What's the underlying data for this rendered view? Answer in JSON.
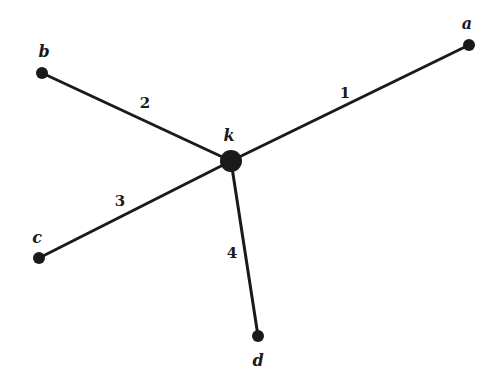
{
  "diagram": {
    "type": "star-graph",
    "colors": {
      "background": "#ffffff",
      "ink": "#1a1a1a"
    },
    "center": {
      "id": "k",
      "label": "k",
      "x": 231,
      "y": 161,
      "r": 11,
      "label_x": 229,
      "label_y": 141
    },
    "nodes": [
      {
        "id": "a",
        "label": "a",
        "x": 469,
        "y": 45,
        "r": 6,
        "label_x": 467,
        "label_y": 29
      },
      {
        "id": "b",
        "label": "b",
        "x": 42,
        "y": 73,
        "r": 6,
        "label_x": 44,
        "label_y": 57
      },
      {
        "id": "c",
        "label": "c",
        "x": 39,
        "y": 258,
        "r": 6,
        "label_x": 37,
        "label_y": 243
      },
      {
        "id": "d",
        "label": "d",
        "x": 258,
        "y": 336,
        "r": 6,
        "label_x": 258,
        "label_y": 366
      }
    ],
    "edges": [
      {
        "id": "1",
        "label": "1",
        "from": "k",
        "to": "a",
        "label_x": 345,
        "label_y": 98
      },
      {
        "id": "2",
        "label": "2",
        "from": "k",
        "to": "b",
        "label_x": 145,
        "label_y": 108
      },
      {
        "id": "3",
        "label": "3",
        "from": "k",
        "to": "c",
        "label_x": 120,
        "label_y": 206
      },
      {
        "id": "4",
        "label": "4",
        "from": "k",
        "to": "d",
        "label_x": 232,
        "label_y": 258
      }
    ]
  }
}
